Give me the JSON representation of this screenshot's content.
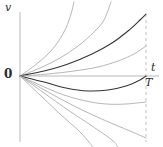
{
  "figure": {
    "name": "velocity-trajectory-family-plot",
    "background": "#ffffff",
    "width": 163,
    "height": 147
  },
  "labels": {
    "y_axis": "v",
    "x_axis": "t",
    "terminal_time": "T",
    "origin": "0"
  },
  "colors": {
    "axis": "#b9b9b9",
    "curve_light": "#a9a9a9",
    "curve_dark": "#343434",
    "dashed": "#c0c0c0",
    "text": "#2b2b2b"
  },
  "chart_data": {
    "type": "line",
    "title": "",
    "xlabel": "t",
    "ylabel": "v",
    "grid": false,
    "legend": null,
    "xlim": [
      0,
      1.0
    ],
    "ylim": [
      -1.0,
      1.0
    ],
    "annotations": [
      {
        "text": "0",
        "x": 0,
        "y": 0,
        "note": "origin label"
      },
      {
        "text": "t",
        "x": 1.05,
        "y": 0.09,
        "note": "time axis label"
      },
      {
        "text": "T",
        "x": 0.98,
        "y": -0.12,
        "note": "terminal time on dashed line"
      }
    ],
    "axes": {
      "origin_px": [
        20,
        76
      ],
      "x_axis_px": {
        "x1": 20,
        "y1": 76,
        "x2": 159,
        "y2": 76
      },
      "y_axis_px": {
        "x1": 20,
        "y1": 12,
        "x2": 20,
        "y2": 142
      },
      "dashed_vertical_px": {
        "x": 146,
        "y1": 14,
        "y2": 142
      }
    },
    "series": [
      {
        "name": "upper-1-steep",
        "style": "light",
        "points_px": [
          [
            20,
            76
          ],
          [
            34,
            66
          ],
          [
            48,
            54
          ],
          [
            58,
            42
          ],
          [
            66,
            28
          ],
          [
            71,
            14
          ],
          [
            74,
            2
          ]
        ]
      },
      {
        "name": "upper-2",
        "style": "light",
        "points_px": [
          [
            20,
            76
          ],
          [
            40,
            68
          ],
          [
            60,
            58
          ],
          [
            78,
            46
          ],
          [
            94,
            32
          ],
          [
            104,
            20
          ],
          [
            111,
            2
          ]
        ]
      },
      {
        "name": "upper-3-dark",
        "style": "dark",
        "points_px": [
          [
            20,
            76
          ],
          [
            44,
            71
          ],
          [
            68,
            64
          ],
          [
            92,
            54
          ],
          [
            112,
            43
          ],
          [
            128,
            31
          ],
          [
            140,
            20
          ],
          [
            146,
            14
          ]
        ]
      },
      {
        "name": "upper-4-shallow",
        "style": "light",
        "points_px": [
          [
            20,
            76
          ],
          [
            48,
            74
          ],
          [
            74,
            71
          ],
          [
            98,
            67
          ],
          [
            118,
            61
          ],
          [
            134,
            54
          ],
          [
            146,
            46
          ]
        ]
      },
      {
        "name": "axis-return-dark",
        "style": "dark",
        "points_px": [
          [
            20,
            76
          ],
          [
            44,
            82
          ],
          [
            66,
            88
          ],
          [
            88,
            91
          ],
          [
            108,
            90
          ],
          [
            126,
            86
          ],
          [
            140,
            80
          ],
          [
            146,
            76
          ]
        ]
      },
      {
        "name": "lower-1",
        "style": "light",
        "points_px": [
          [
            20,
            76
          ],
          [
            42,
            86
          ],
          [
            64,
            95
          ],
          [
            86,
            101
          ],
          [
            106,
            104
          ],
          [
            126,
            104
          ],
          [
            146,
            102
          ]
        ]
      },
      {
        "name": "lower-2-straight",
        "style": "light",
        "points_px": [
          [
            20,
            76
          ],
          [
            48,
            92
          ],
          [
            76,
            107
          ],
          [
            104,
            120
          ],
          [
            130,
            131
          ],
          [
            146,
            138
          ]
        ]
      },
      {
        "name": "lower-3-straight",
        "style": "light",
        "points_px": [
          [
            20,
            76
          ],
          [
            44,
            93
          ],
          [
            68,
            110
          ],
          [
            92,
            126
          ],
          [
            112,
            140
          ],
          [
            118,
            147
          ]
        ]
      },
      {
        "name": "lower-4-straight",
        "style": "light",
        "points_px": [
          [
            20,
            76
          ],
          [
            40,
            95
          ],
          [
            60,
            114
          ],
          [
            80,
            132
          ],
          [
            93,
            147
          ]
        ]
      }
    ]
  }
}
